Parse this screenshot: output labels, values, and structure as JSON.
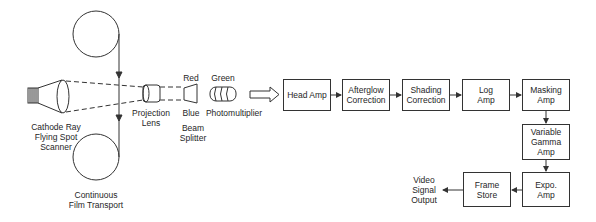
{
  "diagram": {
    "optics": {
      "crt_label": "Cathode Ray\nFlying Spot\nScanner",
      "film_label": "Continuous\nFilm Transport",
      "lens_label": "Projection\nLens",
      "red_label": "Red",
      "blue_label": "Blue",
      "splitter_label": "Beam\nSplitter",
      "green_label": "Green",
      "pmt_label": "Photomultiplier"
    },
    "blocks": [
      {
        "id": "head-amp",
        "label": "Head Amp"
      },
      {
        "id": "afterglow-correction",
        "label": "Afterglow\nCorrection"
      },
      {
        "id": "shading-correction",
        "label": "Shading\nCorrection"
      },
      {
        "id": "log-amp",
        "label": "Log\nAmp"
      },
      {
        "id": "masking-amp",
        "label": "Masking\nAmp"
      },
      {
        "id": "variable-gamma-amp",
        "label": "Variable\nGamma\nAmp"
      },
      {
        "id": "expo-amp",
        "label": "Expo.\nAmp"
      },
      {
        "id": "frame-store",
        "label": "Frame\nStore"
      }
    ],
    "output_label": "Video\nSignal\nOutput",
    "colors": {
      "line": "#333333",
      "background": "#ffffff"
    }
  }
}
